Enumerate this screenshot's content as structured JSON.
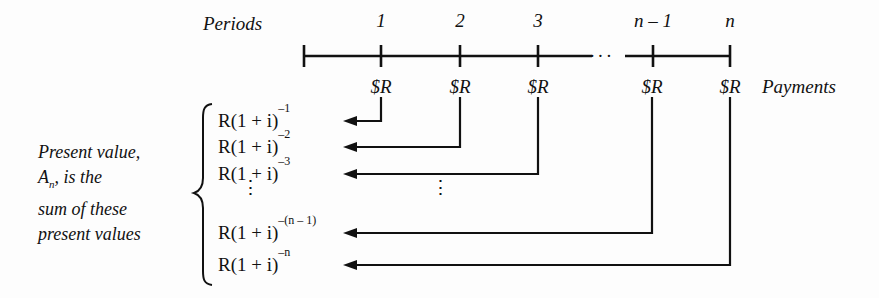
{
  "diagram": {
    "type": "timeline-annuity-present-value",
    "title_labels": {
      "periods": "Periods",
      "payments": "Payments"
    },
    "timeline": {
      "tick_labels": [
        "1",
        "2",
        "3",
        "n – 1",
        "n"
      ],
      "gap_marker": "···",
      "payment_labels": [
        "$R",
        "$R",
        "$R",
        "$R",
        "$R"
      ]
    },
    "bracket_text": {
      "line1": "Present value,",
      "line2_pre": "A",
      "line2_sub": "n",
      "line2_post": ", is the",
      "line3": "sum of these",
      "line4": "present values"
    },
    "rows": [
      {
        "base": "R(1 + i)",
        "exp": "–1"
      },
      {
        "base": "R(1 + i)",
        "exp": "–2"
      },
      {
        "base": "R(1 + i)",
        "exp": "–3"
      },
      {
        "base": "R(1 + i)",
        "exp": "–(n – 1)"
      },
      {
        "base": "R(1 + i)",
        "exp": "–n"
      }
    ],
    "vertical_ellipsis": "⋮",
    "colors": {
      "ink": "#111111",
      "background": "#fdfdfd"
    }
  }
}
